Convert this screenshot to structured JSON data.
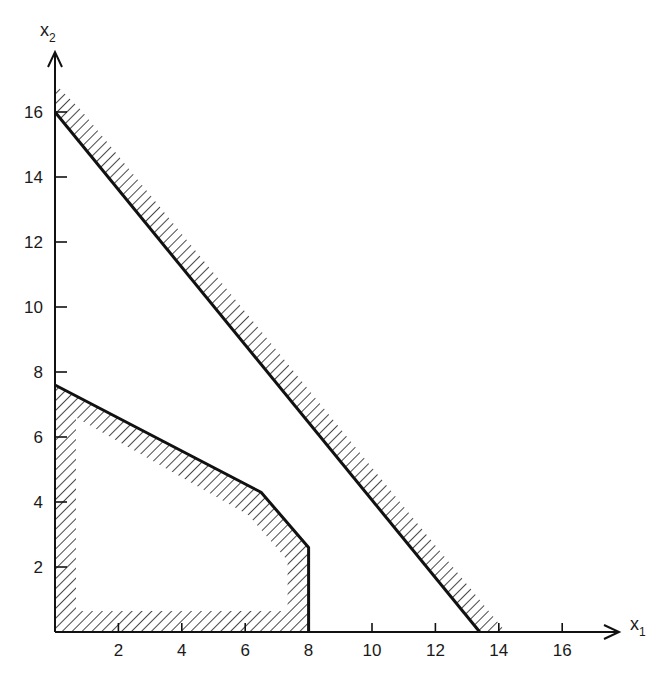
{
  "chart_data": {
    "type": "diagram",
    "title": "",
    "xlabel": "x1",
    "ylabel": "x2",
    "xlabel_main": "x",
    "xlabel_sub": "1",
    "ylabel_main": "x",
    "ylabel_sub": "2",
    "xlim": [
      0,
      18
    ],
    "ylim": [
      0,
      17.5
    ],
    "x_ticks": [
      2,
      4,
      6,
      8,
      10,
      12,
      14,
      16
    ],
    "y_ticks": [
      2,
      4,
      6,
      8,
      10,
      12,
      14,
      16
    ],
    "grid": false,
    "shapes": [
      {
        "name": "feasible-region-polygon",
        "kind": "polygon",
        "hatched": "inside",
        "vertices": [
          [
            0,
            0
          ],
          [
            0,
            7.6
          ],
          [
            6.5,
            4.3
          ],
          [
            8,
            2.6
          ],
          [
            8,
            0
          ]
        ]
      },
      {
        "name": "constraint-line",
        "kind": "line",
        "hatched": "upper-right",
        "points": [
          [
            0,
            16
          ],
          [
            13.4,
            0
          ]
        ]
      }
    ]
  }
}
